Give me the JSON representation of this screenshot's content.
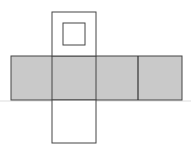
{
  "diagram": {
    "type": "cube-net",
    "colors": {
      "background": "#ffffff",
      "shaded_face": "#c9c9c9",
      "stroke": "#444444",
      "baseline": "#dddddd"
    },
    "baseline": {
      "y": 101
    },
    "shaded_strip": {
      "x": 11,
      "y": 56,
      "w": 171,
      "h": 44
    },
    "strip_faces": [
      {
        "name": "face-1",
        "x": 11,
        "w": 41
      },
      {
        "name": "face-2",
        "x": 52,
        "w": 44
      },
      {
        "name": "face-3",
        "x": 96,
        "w": 42
      },
      {
        "name": "face-4",
        "x": 138,
        "w": 44
      }
    ],
    "top_face": {
      "x": 52,
      "y": 12,
      "w": 44,
      "h": 44
    },
    "bottom_face": {
      "x": 52,
      "y": 100,
      "w": 44,
      "h": 43
    },
    "marker_square": {
      "x": 63,
      "y": 23,
      "w": 22,
      "h": 22
    }
  }
}
